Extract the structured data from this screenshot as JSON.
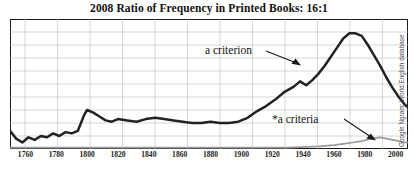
{
  "title": "2008 Ratio of Frequency in Printed Books: 16:1",
  "attribution": "Google Ngram: World English database",
  "annotations": {
    "main_label": "a criterion",
    "secondary_label": "*a criteria"
  },
  "x_tick_labels": [
    "1760",
    "1780",
    "1800",
    "1820",
    "1840",
    "1860",
    "1880",
    "1900",
    "1920",
    "1940",
    "1960",
    "1980",
    "2000"
  ],
  "colors": {
    "main_series": "#232323",
    "secondary_series": "#9a9a9a",
    "grid": "#b9bcc4",
    "frame": "#1b1b1b",
    "title": "#111111"
  },
  "chart_data": {
    "type": "line",
    "title": "2008 Ratio of Frequency in Printed Books: 16:1",
    "xlabel": "",
    "ylabel": "",
    "xlim": [
      1750,
      2008
    ],
    "ylim": [
      0,
      100
    ],
    "grid": true,
    "legend": "annotations-inline",
    "x_ticks": [
      1760,
      1780,
      1800,
      1820,
      1840,
      1860,
      1880,
      1900,
      1920,
      1940,
      1960,
      1980,
      2000
    ],
    "series": [
      {
        "name": "a criterion",
        "color": "#232323",
        "x": [
          1750,
          1754,
          1758,
          1762,
          1766,
          1770,
          1774,
          1778,
          1782,
          1786,
          1790,
          1794,
          1798,
          1800,
          1804,
          1808,
          1812,
          1816,
          1820,
          1826,
          1832,
          1838,
          1844,
          1850,
          1856,
          1862,
          1868,
          1874,
          1880,
          1886,
          1892,
          1898,
          1904,
          1910,
          1916,
          1922,
          1928,
          1934,
          1938,
          1942,
          1946,
          1950,
          1954,
          1958,
          1962,
          1966,
          1970,
          1974,
          1978,
          1982,
          1986,
          1990,
          1994,
          1998,
          2002,
          2006,
          2008
        ],
        "y": [
          14,
          8,
          5,
          9,
          7,
          10,
          9,
          12,
          10,
          13,
          12,
          14,
          26,
          30,
          28,
          25,
          22,
          21,
          23,
          22,
          21,
          23,
          24,
          23,
          22,
          21,
          20,
          20,
          21,
          20,
          20,
          21,
          24,
          29,
          33,
          38,
          44,
          48,
          52,
          49,
          53,
          58,
          64,
          71,
          78,
          85,
          89,
          89,
          87,
          80,
          72,
          64,
          55,
          47,
          40,
          34,
          32
        ]
      },
      {
        "name": "*a criteria",
        "color": "#9a9a9a",
        "x": [
          1750,
          1800,
          1850,
          1900,
          1930,
          1950,
          1960,
          1966,
          1972,
          1978,
          1984,
          1990,
          1994,
          1998,
          2002,
          2006,
          2008
        ],
        "y": [
          1,
          1,
          1,
          1,
          1,
          2,
          3,
          4,
          5,
          6,
          8,
          9,
          8,
          7,
          6,
          5,
          5
        ]
      }
    ]
  }
}
